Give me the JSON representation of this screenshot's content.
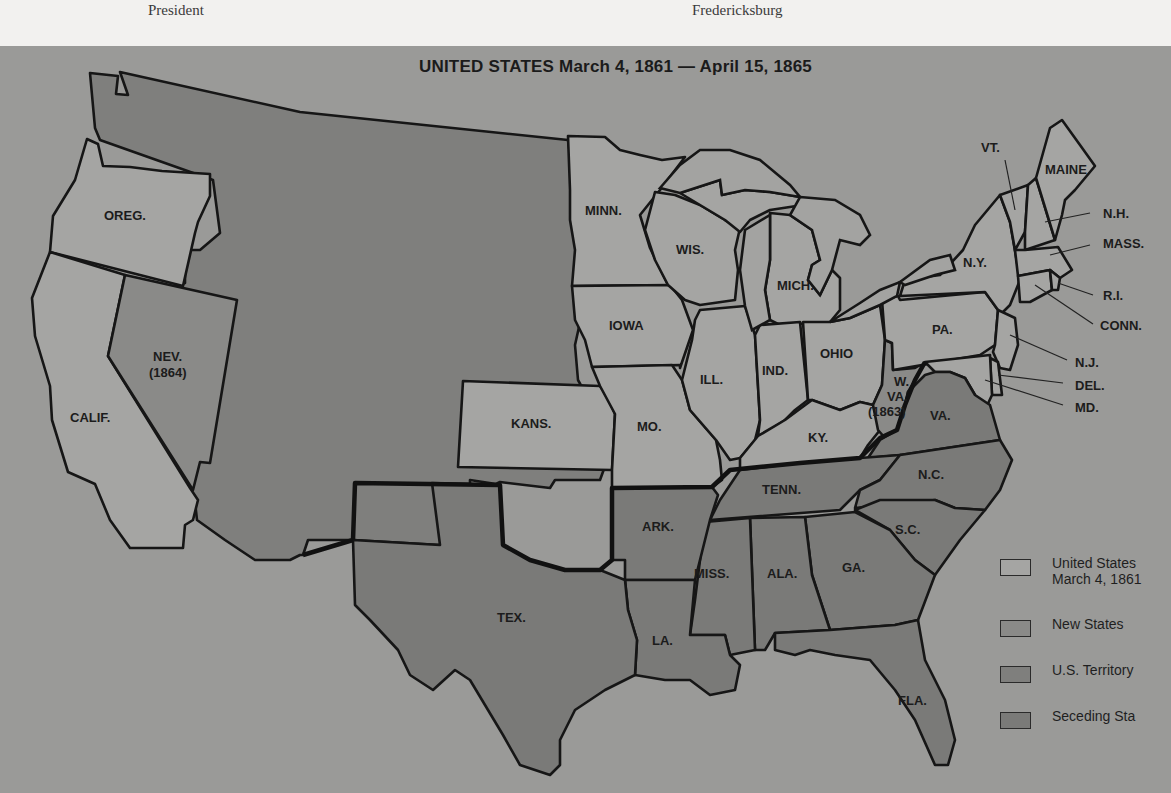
{
  "page_captions": {
    "left": "President",
    "right": "Fredericksburg"
  },
  "map": {
    "title": "UNITED STATES March 4, 1861 — April 15, 1865",
    "colors": {
      "background": "#9a9a98",
      "united_states_1861": "#a5a5a3",
      "new_states": "#8a8a88",
      "us_territory": "#7f7f7d",
      "seceding_states": "#7a7a78",
      "border": "#161616"
    },
    "states": {
      "oreg": "OREG.",
      "calif": "CALIF.",
      "nev": "NEV.",
      "nev_year": "(1864)",
      "minn": "MINN.",
      "wis": "WIS.",
      "mich": "MICH.",
      "iowa": "IOWA",
      "ill": "ILL.",
      "ind": "IND.",
      "ohio": "OHIO",
      "kans": "KANS.",
      "mo": "MO.",
      "ky": "KY.",
      "wva_1": "W.",
      "wva_2": "VA.",
      "wva_year": "(1863)",
      "va": "VA.",
      "nc": "N.C.",
      "tenn": "TENN.",
      "sc": "S.C.",
      "ga": "GA.",
      "ala": "ALA.",
      "miss": "MISS.",
      "ark": "ARK.",
      "la": "LA.",
      "tex": "TEX.",
      "fla": "FLA.",
      "ny": "N.Y.",
      "pa": "PA.",
      "vt": "VT.",
      "maine": "MAINE",
      "nh": "N.H.",
      "mass": "MASS.",
      "ri": "R.I.",
      "conn": "CONN.",
      "nj": "N.J.",
      "del": "DEL.",
      "md": "MD."
    },
    "legend": [
      {
        "label_line1": "United States",
        "label_line2": "March 4, 1861",
        "swatch": "#a5a5a3"
      },
      {
        "label_line1": "New States",
        "label_line2": "",
        "swatch": "#8a8a88"
      },
      {
        "label_line1": "U.S. Territory",
        "label_line2": "",
        "swatch": "#7f7f7d"
      },
      {
        "label_line1": "Seceding Sta",
        "label_line2": "",
        "swatch": "#7a7a78"
      }
    ]
  }
}
